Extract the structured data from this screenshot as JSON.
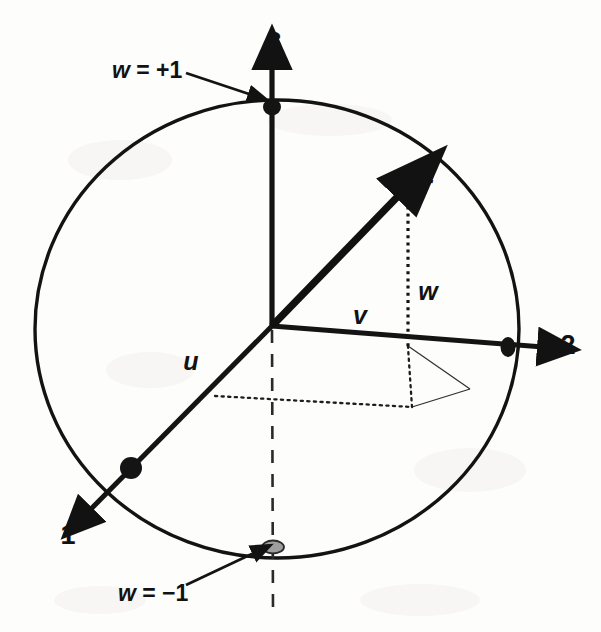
{
  "figure": {
    "type": "3d-unit-sphere-vector-diagram",
    "background_color": "#fdfdfc",
    "stroke_color": "#121212"
  },
  "axes": [
    {
      "name": "axis-1",
      "label": "1",
      "x": 68,
      "y": 537
    },
    {
      "name": "axis-2",
      "label": "2",
      "x": 568,
      "y": 347
    },
    {
      "name": "axis-3",
      "label": "3",
      "x": 274,
      "y": 44
    }
  ],
  "vectors": [
    {
      "name": "vector-r",
      "label": "r",
      "x": 427,
      "y": 187
    },
    {
      "name": "component-u",
      "label": "u",
      "x": 191,
      "y": 363
    },
    {
      "name": "component-v",
      "label": "v",
      "x": 360,
      "y": 317
    },
    {
      "name": "component-w",
      "label": "w",
      "x": 428,
      "y": 293
    }
  ],
  "annotations": [
    {
      "name": "annotation-w-plus-one",
      "symbol": "w",
      "relation": " = +1",
      "text": "w = +1",
      "x": 112,
      "y": 72,
      "arrow": {
        "x1": 186,
        "y1": 73,
        "x2": 255,
        "y2": 96
      }
    },
    {
      "name": "annotation-w-minus-one",
      "symbol": "w",
      "relation": " = −1",
      "text": "w = −1",
      "x": 118,
      "y": 595,
      "arrow": {
        "x1": 186,
        "y1": 585,
        "x2": 258,
        "y2": 551
      }
    }
  ],
  "sphere": {
    "name": "sphere-outline",
    "center_x": 277,
    "center_y": 329,
    "radius_x": 242,
    "radius_y": 229
  },
  "origin": {
    "x": 272,
    "y": 325
  },
  "markers": [
    {
      "name": "marker-axis3-top",
      "x": 272,
      "y": 107,
      "style": "filled",
      "color": "#141414"
    },
    {
      "name": "marker-axis2-right",
      "x": 508,
      "y": 347,
      "style": "filled",
      "color": "#141414"
    },
    {
      "name": "marker-axis1-front",
      "x": 131,
      "y": 468,
      "style": "filled",
      "color": "#141414"
    },
    {
      "name": "marker-sphere-bottom",
      "x": 273,
      "y": 547,
      "style": "hollow",
      "color": "#9a9a9a"
    }
  ]
}
